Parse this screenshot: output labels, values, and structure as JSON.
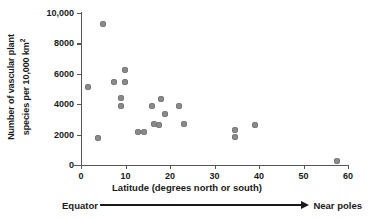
{
  "chart_data": {
    "type": "scatter",
    "title": "",
    "xlabel": "Latitude (degrees north or south)",
    "ylabel_line1": "Number of vascular plant",
    "ylabel_line2": "species per 10,000 km",
    "ylabel_exponent": "2",
    "xlim": [
      0,
      60
    ],
    "ylim": [
      0,
      10000
    ],
    "grid": false,
    "legend": null,
    "x_ticks": [
      "0",
      "10",
      "20",
      "30",
      "40",
      "50",
      "60"
    ],
    "x_tick_values": [
      0,
      10,
      20,
      30,
      40,
      50,
      60
    ],
    "y_ticks": [
      "0",
      "2000",
      "4000",
      "6000",
      "8000",
      "10,000"
    ],
    "y_tick_values": [
      0,
      2000,
      4000,
      6000,
      8000,
      10000
    ],
    "point_color": "#8a8a8a",
    "axis_color": "#555555",
    "points": [
      {
        "x": 4.9,
        "y": 9300
      },
      {
        "x": 1.5,
        "y": 5100
      },
      {
        "x": 7.5,
        "y": 5450
      },
      {
        "x": 9.8,
        "y": 6250
      },
      {
        "x": 9.8,
        "y": 5450
      },
      {
        "x": 9.0,
        "y": 4400
      },
      {
        "x": 9.0,
        "y": 3900
      },
      {
        "x": 3.8,
        "y": 1800
      },
      {
        "x": 12.8,
        "y": 2150
      },
      {
        "x": 14.2,
        "y": 2200
      },
      {
        "x": 16.4,
        "y": 2700
      },
      {
        "x": 16.0,
        "y": 3850
      },
      {
        "x": 17.6,
        "y": 2600
      },
      {
        "x": 18.0,
        "y": 4350
      },
      {
        "x": 18.9,
        "y": 3350
      },
      {
        "x": 22.0,
        "y": 3850
      },
      {
        "x": 23.2,
        "y": 2700
      },
      {
        "x": 34.6,
        "y": 2300
      },
      {
        "x": 34.6,
        "y": 1850
      },
      {
        "x": 39.0,
        "y": 2600
      },
      {
        "x": 57.5,
        "y": 250
      }
    ],
    "annotation": {
      "left": "Equator",
      "right": "Near poles",
      "arrow": "rightwards-arrow"
    }
  }
}
